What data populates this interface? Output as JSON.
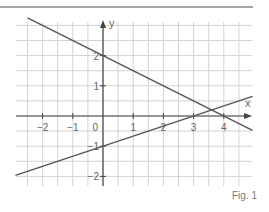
{
  "figure": {
    "caption": "Fig. 1"
  },
  "colors": {
    "grid": "#d3d3d3",
    "axis": "#444444",
    "line": "#555555",
    "rule": "#888888",
    "label": "#666666"
  },
  "chart_data": {
    "type": "line",
    "title": "",
    "xlabel": "x",
    "ylabel": "y",
    "xlim": [
      -2.9,
      4.95
    ],
    "ylim": [
      -2.3,
      3.2
    ],
    "grid": true,
    "grid_step": 0.5,
    "x_ticks": [
      -2,
      -1,
      1,
      2,
      3,
      4
    ],
    "y_ticks": [
      -2,
      -1,
      1,
      2
    ],
    "x_tick_labels": [
      "−2",
      "−1",
      "1",
      "2",
      "3",
      "4"
    ],
    "y_tick_labels": [
      "−2",
      "−1",
      "1",
      "2"
    ],
    "origin_label": "0",
    "series": [
      {
        "name": "line-1",
        "equation": "y = -0.5x + 2",
        "x": [
          -2.5,
          4.95
        ],
        "y": [
          3.25,
          -0.475
        ]
      },
      {
        "name": "line-2",
        "equation": "y = (1/3)x - 1",
        "x": [
          -2.9,
          4.95
        ],
        "y": [
          -1.967,
          0.65
        ]
      }
    ],
    "intersection": {
      "x": 3.6,
      "y": 0.2
    }
  }
}
